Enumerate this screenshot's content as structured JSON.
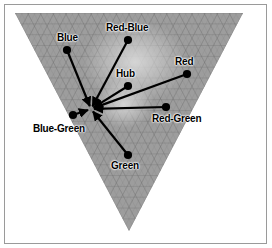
{
  "figure": {
    "background_color": "#ffffff",
    "border_color": "#9a9a9a"
  },
  "diagram": {
    "type": "vector-field-convergence",
    "shape": "inverted-triangle",
    "triangle": {
      "top_left": [
        15,
        13
      ],
      "top_right": [
        243,
        13
      ],
      "bottom_apex": [
        129,
        231
      ],
      "fill_color": "#9d9d9d",
      "mesh_color": "#6f6f6f",
      "highlight_color": "#d8d8d8"
    },
    "convergence_point": [
      91,
      109
    ],
    "arrow_color": "#000000",
    "nodes": [
      {
        "id": "blue",
        "label": "Blue",
        "dot": [
          67,
          50
        ],
        "label_pos": [
          57,
          33
        ],
        "label_align": "left"
      },
      {
        "id": "red-blue",
        "label": "Red-Blue",
        "dot": [
          128,
          40
        ],
        "label_pos": [
          106,
          23
        ],
        "label_align": "left"
      },
      {
        "id": "red",
        "label": "Red",
        "dot": [
          187,
          74
        ],
        "label_pos": [
          175,
          57
        ],
        "label_align": "left"
      },
      {
        "id": "hub",
        "label": "Hub",
        "dot": [
          128,
          86
        ],
        "label_pos": [
          116,
          69
        ],
        "label_align": "left"
      },
      {
        "id": "red-green",
        "label": "Red-Green",
        "dot": [
          166,
          107
        ],
        "label_pos": [
          152,
          114
        ],
        "label_align": "left"
      },
      {
        "id": "blue-green",
        "label": "Blue-Green",
        "dot": [
          73,
          115
        ],
        "label_pos": [
          33,
          124
        ],
        "label_align": "left"
      },
      {
        "id": "green",
        "label": "Green",
        "dot": [
          128,
          155
        ],
        "label_pos": [
          111,
          161
        ],
        "label_align": "left"
      }
    ]
  }
}
